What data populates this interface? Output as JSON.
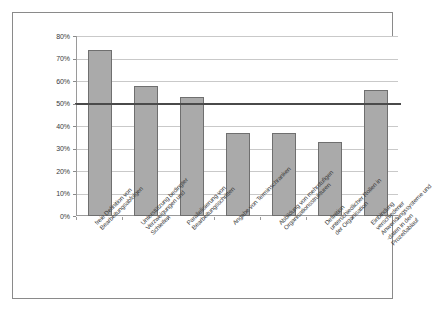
{
  "chart_data": {
    "type": "bar",
    "title": "",
    "subtitle": "",
    "xlabel": "",
    "ylabel": "",
    "ylim": [
      0,
      80
    ],
    "ytick_labels": [
      "0%",
      "10%",
      "20%",
      "30%",
      "40%",
      "50%",
      "60%",
      "70%",
      "80%"
    ],
    "ytick_values": [
      0,
      10,
      20,
      30,
      40,
      50,
      60,
      70,
      80
    ],
    "grid": true,
    "legend": false,
    "legend_position": "none",
    "categories": [
      "freie Definition von Bearbeitungsabfolgen",
      "Unterstützung bedingter Verzweigungen und Schleifen",
      "Parallelisierung von Bearbeitungsschritten",
      "Angabe von Terminschranken",
      "Abbildung von mehrstufigen Organisationsstrukturen",
      "Definition unterschiedlicher Rollen in der Organisation",
      "Einbindung verschiedener Anwendungssysteme und -daten in den Prozeßablauf"
    ],
    "category_lines": [
      [
        "freie Definition von",
        "Bearbeitungsabfolgen"
      ],
      [
        "Unterstützung bedingter",
        "Verzweigungen und",
        "Schleifen"
      ],
      [
        "Parallelisierung von",
        "Bearbeitungsschritten"
      ],
      [
        "Angabe von Terminschranken"
      ],
      [
        "Abbildung von mehrstufigen",
        "Organisationsstrukturen"
      ],
      [
        "Definition",
        "unterschiedlicher Rollen in",
        "der Organisation"
      ],
      [
        "Einbindung",
        "verschiedener",
        "Anwendungssysteme und",
        "-daten in den",
        "Prozeßablauf"
      ]
    ],
    "values": [
      74,
      58,
      53,
      37,
      37,
      33,
      56
    ],
    "value_unit": "%",
    "annotations": [
      {
        "type": "hline",
        "name": "threshold-50",
        "value": 50,
        "label": ""
      }
    ],
    "colors": {
      "bar_fill": "#aaaaaa",
      "bar_border": "#6f6f6f",
      "gridline": "#c9c9c9",
      "axis": "#9a9a9a",
      "threshold": "#4a4a4a",
      "frame": "#8a8a8a",
      "text": "#3d3d3d",
      "background": "#ffffff"
    }
  }
}
